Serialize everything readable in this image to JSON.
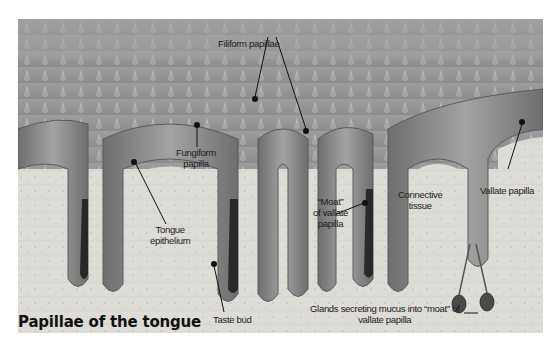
{
  "figure": {
    "title": "Papillae of the tongue",
    "labels": {
      "filiform": "Filiform papillae",
      "fungiform_line1": "Fungiform",
      "fungiform_line2": "papilla",
      "tongue_epithelium_line1": "Tongue",
      "tongue_epithelium_line2": "epithelium",
      "moat_line1": "“Moat”",
      "moat_line2": "of vallate",
      "moat_line3": "papilla",
      "connective_line1": "Connective",
      "connective_line2": "tissue",
      "vallate": "Vallate papilla",
      "taste_bud": "Taste bud",
      "glands_line1": "Glands secreting mucus into “moat” of",
      "glands_line2": "vallate papilla"
    },
    "colors": {
      "background": "#ffffff",
      "surface": "#9a9a9a",
      "epithelium": "#8a8a8a",
      "connective": "#dcdcd6",
      "moat": "#1c1c1c",
      "text": "#1a1a1a"
    }
  }
}
